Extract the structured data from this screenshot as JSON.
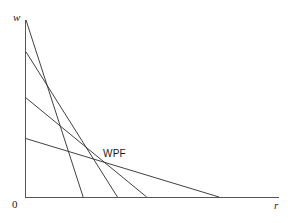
{
  "figure": {
    "background_color": "#ffffff",
    "line_color": "#2b2b2b",
    "axis_color": "#4a4a4a",
    "origin_label": "0"
  },
  "annotations": {
    "wpf_label": "WPF"
  },
  "chart_data": {
    "type": "line",
    "title": "",
    "subtitle": "",
    "xlabel": "r",
    "ylabel": "w",
    "xlim": [
      0,
      1
    ],
    "ylim": [
      0,
      1
    ],
    "grid": false,
    "legend": "none",
    "tick_labels": {
      "x": [
        "0"
      ],
      "y": [
        "0"
      ]
    },
    "annotations": [
      {
        "text": "WPF",
        "x": 0.32,
        "y": 0.3,
        "note": "labels the outer envelope formed by the wage-profit lines"
      }
    ],
    "series": [
      {
        "name": "technique-1",
        "description": "steepest wage-profit line, highest wage intercept",
        "x": [
          0.0,
          0.225
        ],
        "y": [
          1.0,
          0.0
        ],
        "w_intercept": 1.0,
        "r_intercept": 0.225
      },
      {
        "name": "technique-2",
        "description": "second wage-profit line",
        "x": [
          0.0,
          0.36
        ],
        "y": [
          0.82,
          0.0
        ],
        "w_intercept": 0.82,
        "r_intercept": 0.36
      },
      {
        "name": "technique-3",
        "description": "third wage-profit line",
        "x": [
          0.0,
          0.475
        ],
        "y": [
          0.56,
          0.0
        ],
        "w_intercept": 0.56,
        "r_intercept": 0.475
      },
      {
        "name": "technique-4",
        "description": "flattest wage-profit line, largest profit-rate intercept",
        "x": [
          0.0,
          0.76
        ],
        "y": [
          0.33,
          0.0
        ],
        "w_intercept": 0.33,
        "r_intercept": 0.76
      }
    ]
  }
}
